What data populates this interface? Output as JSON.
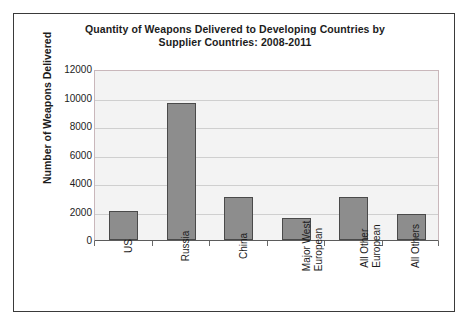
{
  "chart_data": {
    "type": "bar",
    "title": "Quantity of Weapons Delivered to Developing Countries by Supplier Countries: 2008-2011",
    "title_line1": "Quantity of Weapons Delivered to Developing Countries by",
    "title_line2": "Supplier Countries: 2008-2011",
    "xlabel": "",
    "ylabel": "Number of Weapons Delivered",
    "ylim": [
      0,
      12000
    ],
    "ytick_step": 2000,
    "ytick_labels": [
      "12000",
      "10000",
      "8000",
      "6000",
      "4000",
      "2000",
      "0"
    ],
    "ytick_values": [
      12000,
      10000,
      8000,
      6000,
      4000,
      2000,
      0
    ],
    "grid": true,
    "grid_axis": "y",
    "legend": null,
    "categories": [
      "US",
      "Russia",
      "China",
      "Major West European",
      "All Other European",
      "All Others"
    ],
    "category_lines": [
      [
        "US"
      ],
      [
        "Russia"
      ],
      [
        "China"
      ],
      [
        "Major West",
        "European"
      ],
      [
        "All Other",
        "European"
      ],
      [
        "All Others"
      ]
    ],
    "values": [
      2050,
      9650,
      3000,
      1550,
      3020,
      1800
    ],
    "bar_color": "#8d8d8d",
    "bar_border_color": "#4a4a4a",
    "plot_background": "#f3f3f3",
    "grid_color": "#cfcfcf",
    "frame_color": "#3a3a3a"
  }
}
